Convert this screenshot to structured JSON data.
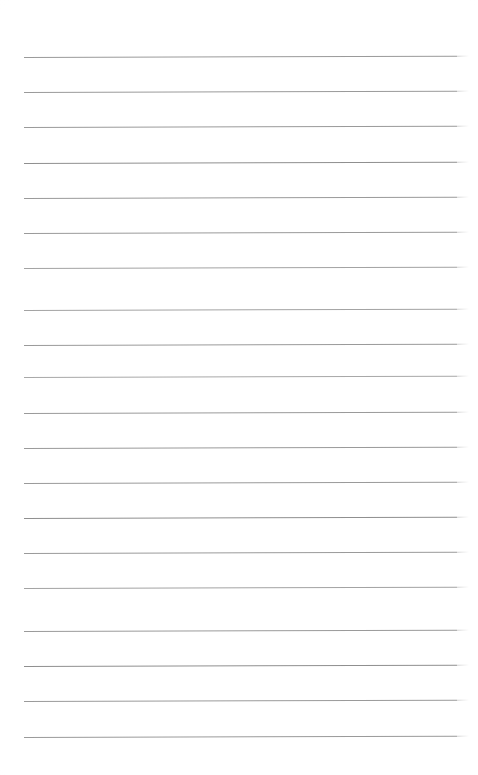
{
  "page": {
    "kind": "lined-notepad-page",
    "width": 478,
    "height": 775,
    "background_color": "#ffffff",
    "content_text": "",
    "has_handwriting": false
  },
  "ruling": {
    "line_count": 20,
    "line_color": "#9a9a9a",
    "line_color_light": "#bdbdbd",
    "line_thickness_px": 1,
    "left_x": 24,
    "right_x": 457,
    "line_length_px": 433,
    "first_line_y": 57,
    "line_spacing_px": 35.2,
    "tilt_deg": -0.18,
    "top_margin_px": 57,
    "bottom_margin_px": 38,
    "lines": [
      {
        "index": 1,
        "y": 57,
        "color": "#9a9a9a"
      },
      {
        "index": 2,
        "y": 92,
        "color": "#9a9a9a"
      },
      {
        "index": 3,
        "y": 127,
        "color": "#9a9a9a"
      },
      {
        "index": 4,
        "y": 163,
        "color": "#8f8f8f"
      },
      {
        "index": 5,
        "y": 198,
        "color": "#9a9a9a"
      },
      {
        "index": 6,
        "y": 233,
        "color": "#9a9a9a"
      },
      {
        "index": 7,
        "y": 268,
        "color": "#a3a3a3"
      },
      {
        "index": 8,
        "y": 310,
        "color": "#a3a3a3"
      },
      {
        "index": 9,
        "y": 345,
        "color": "#9a9a9a"
      },
      {
        "index": 10,
        "y": 377,
        "color": "#a8a8a8"
      },
      {
        "index": 11,
        "y": 413,
        "color": "#9a9a9a"
      },
      {
        "index": 12,
        "y": 448,
        "color": "#9a9a9a"
      },
      {
        "index": 13,
        "y": 483,
        "color": "#9a9a9a"
      },
      {
        "index": 14,
        "y": 518,
        "color": "#8f8f8f"
      },
      {
        "index": 15,
        "y": 553,
        "color": "#9a9a9a"
      },
      {
        "index": 16,
        "y": 588,
        "color": "#a3a3a3"
      },
      {
        "index": 17,
        "y": 631,
        "color": "#9a9a9a"
      },
      {
        "index": 18,
        "y": 666,
        "color": "#8f8f8f"
      },
      {
        "index": 19,
        "y": 701,
        "color": "#9a9a9a"
      },
      {
        "index": 20,
        "y": 737,
        "color": "#9a9a9a"
      }
    ]
  }
}
